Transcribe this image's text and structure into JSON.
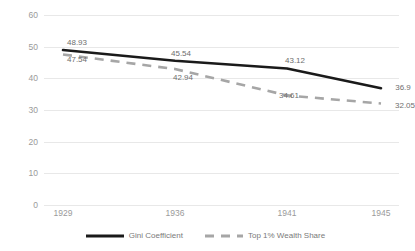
{
  "chart_data": {
    "type": "line",
    "title": "",
    "xlabel": "",
    "ylabel": "",
    "categories": [
      "1929",
      "1936",
      "1941",
      "1945"
    ],
    "ylim": [
      0,
      60
    ],
    "yticks": [
      "0",
      "10",
      "20",
      "30",
      "40",
      "50",
      "60"
    ],
    "grid": true,
    "legend_position": "bottom",
    "series": [
      {
        "name": "Gini Coefficient",
        "style": "solid",
        "color": "#1a1a1a",
        "values": [
          48.93,
          45.54,
          43.12,
          36.9
        ],
        "labels": [
          "48.93",
          "45.54",
          "43.12",
          "36.9"
        ]
      },
      {
        "name": "Top 1% Wealth Share",
        "style": "dashed",
        "color": "#a6a6a6",
        "values": [
          47.54,
          42.94,
          34.61,
          32.05
        ],
        "labels": [
          "47.54",
          "42.94",
          "34.61",
          "32.05"
        ]
      }
    ]
  },
  "axis": {
    "y_tick_0": "0",
    "y_tick_1": "10",
    "y_tick_2": "20",
    "y_tick_3": "30",
    "y_tick_4": "40",
    "y_tick_5": "50",
    "y_tick_6": "60",
    "x_tick_0": "1929",
    "x_tick_1": "1936",
    "x_tick_2": "1941",
    "x_tick_3": "1945"
  },
  "legend": {
    "items": [
      {
        "label": "Gini Coefficient"
      },
      {
        "label": "Top 1% Wealth Share"
      }
    ]
  },
  "title_sliver": ""
}
